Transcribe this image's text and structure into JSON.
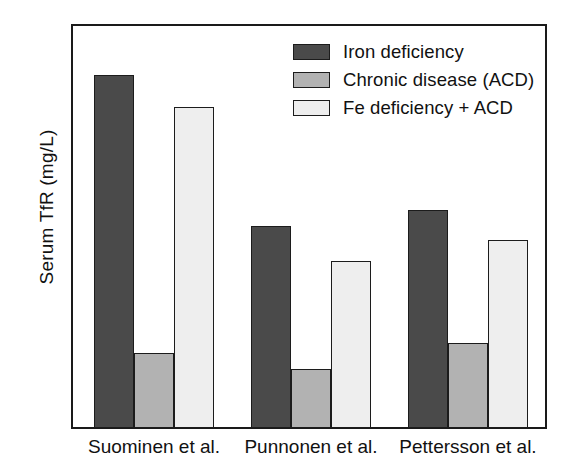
{
  "chart_data": {
    "type": "bar",
    "title": "",
    "xlabel": "",
    "ylabel": "Serum TfR (mg/L)",
    "ylim": [
      0,
      12.6
    ],
    "yticks": [
      0,
      4,
      8,
      12
    ],
    "ytick_labels": [
      "0",
      "4",
      "8",
      "12"
    ],
    "yticks_minor": [
      2,
      6,
      10
    ],
    "grid": false,
    "legend_position": "top-right",
    "categories": [
      "Suominen et al.",
      "Punnonen et al.",
      "Pettersson et al."
    ],
    "series": [
      {
        "name": "Iron deficiency",
        "color": "#4a4a4a",
        "values": [
          11.0,
          6.3,
          6.8
        ]
      },
      {
        "name": "Chronic disease (ACD)",
        "color": "#b2b2b2",
        "values": [
          2.35,
          1.85,
          2.65
        ]
      },
      {
        "name": "Fe deficiency + ACD",
        "color": "#eeeeee",
        "values": [
          10.0,
          5.2,
          5.85
        ]
      }
    ]
  },
  "axis": {
    "y_title": "Serum TfR (mg/L)",
    "tick_labels": {
      "t0": "0",
      "t4": "4",
      "t8": "8",
      "t12": "12"
    }
  },
  "categories": {
    "c0": "Suominen et al.",
    "c1": "Punnonen et al.",
    "c2": "Pettersson et al."
  },
  "legend": {
    "items": [
      {
        "label": "Iron deficiency"
      },
      {
        "label": "Chronic disease (ACD)"
      },
      {
        "label": "Fe deficiency + ACD"
      }
    ]
  },
  "colors": {
    "iron_deficiency": "#4a4a4a",
    "chronic_disease": "#b2b2b2",
    "fe_plus_acd": "#eeeeee",
    "axis": "#1a1a1a",
    "background": "#ffffff"
  }
}
